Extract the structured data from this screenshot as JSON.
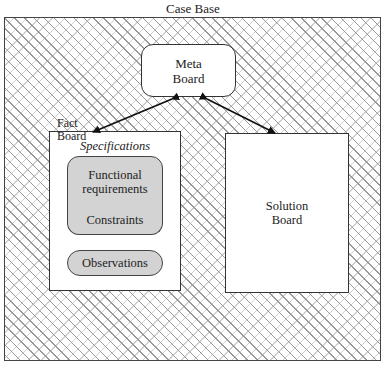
{
  "diagram": {
    "title": "Case Base",
    "meta_board": {
      "line1": "Meta",
      "line2": "Board"
    },
    "fact_board": {
      "label_line1": "Fact",
      "label_line2": "Board",
      "specifications_title": "Specifications",
      "functional_requirements": {
        "line1": "Functional",
        "line2": "requirements"
      },
      "constraints": "Constraints",
      "observations": "Observations"
    },
    "solution_board": {
      "line1": "Solution",
      "line2": "Board"
    },
    "connections": [
      {
        "from": "Meta Board",
        "to": "Fact Board",
        "type": "bidirectional-arrow"
      },
      {
        "from": "Meta Board",
        "to": "Solution Board",
        "type": "bidirectional-arrow"
      }
    ]
  }
}
